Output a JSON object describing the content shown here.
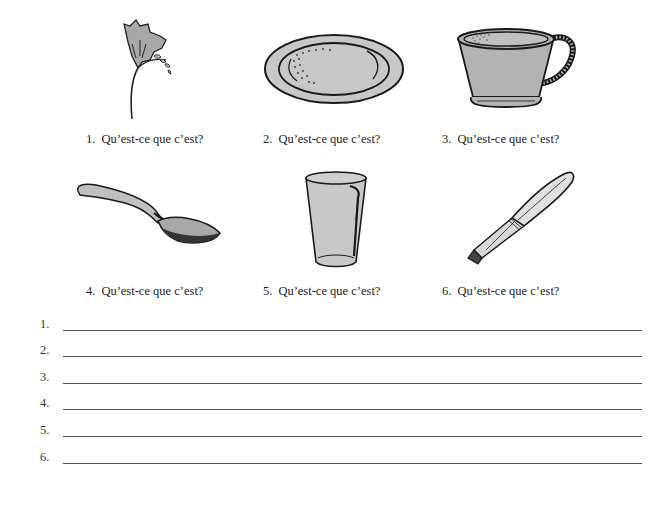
{
  "worksheet": {
    "items": [
      {
        "number": "1.",
        "question": "Qu’est-ce que c’est?",
        "image": "flower-icon"
      },
      {
        "number": "2.",
        "question": "Qu’est-ce que c’est?",
        "image": "plate-icon"
      },
      {
        "number": "3.",
        "question": "Qu’est-ce que c’est?",
        "image": "cup-icon"
      },
      {
        "number": "4.",
        "question": "Qu’est-ce que c’est?",
        "image": "spoon-icon"
      },
      {
        "number": "5.",
        "question": "Qu’est-ce que c’est?",
        "image": "glass-icon"
      },
      {
        "number": "6.",
        "question": "Qu’est-ce que c’est?",
        "image": "knife-icon"
      }
    ],
    "answers": [
      {
        "number": "1.",
        "value": ""
      },
      {
        "number": "2.",
        "value": ""
      },
      {
        "number": "3.",
        "value": ""
      },
      {
        "number": "4.",
        "value": ""
      },
      {
        "number": "5.",
        "value": ""
      },
      {
        "number": "6.",
        "value": ""
      }
    ]
  },
  "colors": {
    "fill_gray": "#b3b3b3",
    "stroke": "#1a1a1a",
    "line": "#555555"
  }
}
